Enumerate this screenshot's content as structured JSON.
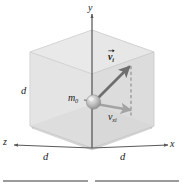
{
  "figure": {
    "kind": "3d-cube-vector-diagram",
    "background_color": "#ffffff"
  },
  "axes": {
    "y_label": "y",
    "x_label": "x",
    "z_label": "z",
    "axis_color": "#4d4d4d"
  },
  "dimensions": {
    "left_label": "d",
    "front_label": "d",
    "right_label": "d"
  },
  "particle": {
    "mass_label": "m",
    "mass_subscript": "0",
    "sphere_color": "#b5b5b5",
    "sphere_highlight": "#e8e8e8"
  },
  "vectors": [
    {
      "name": "velocity-vector",
      "symbol": "v",
      "subscript": "i",
      "has_overarrow": true,
      "color": "#6e6e6e"
    },
    {
      "name": "velocity-x-component",
      "symbol": "v",
      "subscript": "xi",
      "has_overarrow": false,
      "color": "#9b9b9b"
    }
  ],
  "cube": {
    "face_fill_light": "#f2f2f2",
    "face_fill_mid": "#e6e6e6",
    "face_fill_dark": "#dcdcdc",
    "edge_color": "#b8b8b8"
  },
  "guides": {
    "dashed_line_color": "#8a8a8a"
  },
  "footer": {
    "rule_color": "#9a9a9a"
  }
}
